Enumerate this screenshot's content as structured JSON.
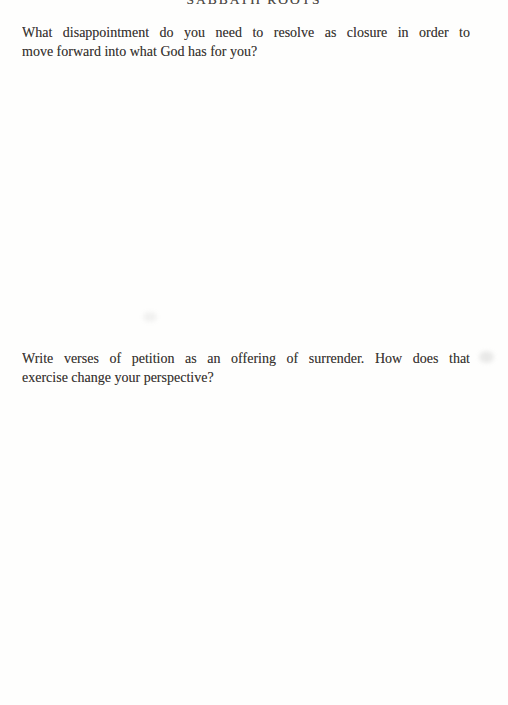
{
  "colors": {
    "page_background": "#fefefd",
    "body_text": "#3a3633",
    "header_text": "#4d4a46"
  },
  "running_header": {
    "title": "SABBATH ROOTS"
  },
  "questions": [
    {
      "text": "What disappointment do you need to resolve as closure in order to move forward into what God has for you?",
      "lines": [
        "What disappointment do you need to resolve as closure in order to",
        "move forward into what God has for you?"
      ]
    },
    {
      "text": "Write verses of petition as an offering of surrender. How does that exercise change your perspective?",
      "lines": [
        "Write verses of petition as an offering of surrender. How does that",
        "exercise change your perspective?"
      ]
    }
  ]
}
